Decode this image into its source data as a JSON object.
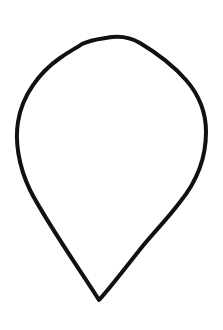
{
  "canvas": {
    "width": 223,
    "height": 330,
    "background": "#ffffff"
  },
  "drawing": {
    "subject": "teardrop-outline",
    "description": "Hand-drawn inverted teardrop / pin shape outline with pointed tip at bottom",
    "stroke_color": "#111111",
    "stroke_width": 4,
    "fill": "none",
    "path": "M 99 300 C 80 270, 45 220, 30 190 C 18 165, 15 140, 18 122 C 22 95, 40 72, 60 58 C 70 51, 78 47, 82 44 C 92 39, 100 39, 112 37 C 122 36, 130 37, 140 43 C 155 52, 172 64, 186 80 C 200 96, 206 112, 206 132 C 206 158, 198 180, 180 202 C 165 222, 150 236, 138 252 C 122 272, 110 288, 99 300 Z"
  }
}
